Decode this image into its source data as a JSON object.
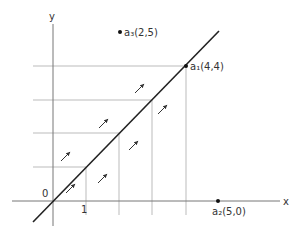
{
  "diagram": {
    "type": "coordinate-plane-flow",
    "axes": {
      "x_label": "x",
      "y_label": "y",
      "origin_label": "0",
      "x_tick_label": "1"
    },
    "line": {
      "equation": "y = x",
      "color": "#222222"
    },
    "points": [
      {
        "id": "a1",
        "label": "a₁(4,4)",
        "x": 4,
        "y": 4
      },
      {
        "id": "a2",
        "label": "a₂(5,0)",
        "x": 5,
        "y": 0
      },
      {
        "id": "a3",
        "label": "a₃(2,5)",
        "x": 2,
        "y": 5
      }
    ],
    "grid": {
      "horizontal_at_y": [
        1,
        2,
        3,
        4
      ],
      "vertical_at_x": [
        1,
        2,
        3,
        4
      ],
      "color": "#aaaaaa"
    },
    "arrows": {
      "direction": "parallel to y = x (northeast)",
      "count": 7,
      "color": "#333333"
    }
  }
}
